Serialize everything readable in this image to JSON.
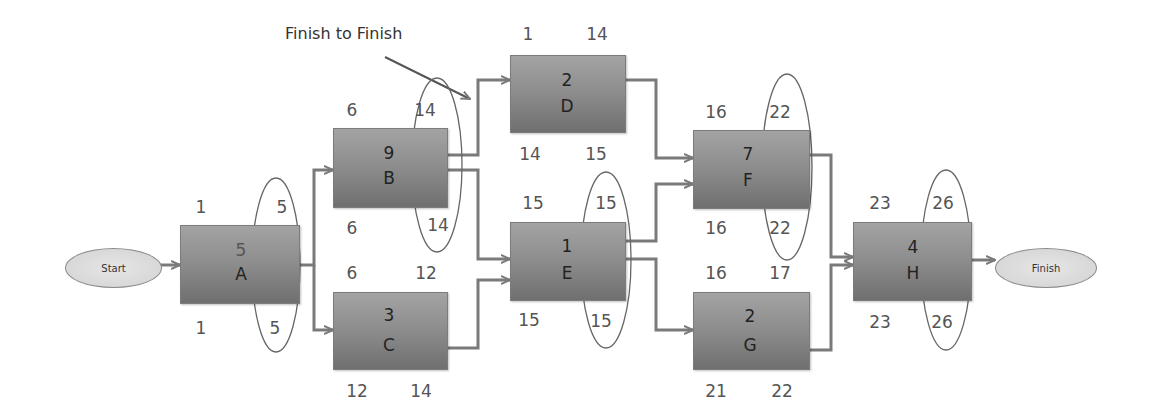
{
  "diagram": {
    "type": "network-diagram",
    "annotation": "Finish to Finish",
    "start_label": "Start",
    "finish_label": "Finish"
  },
  "activities": {
    "A": {
      "name": "A",
      "duration": "5",
      "es": "1",
      "ef": "5",
      "ls": "1",
      "lf": "5",
      "critical_circle": true
    },
    "B": {
      "name": "B",
      "duration": "9",
      "es": "6",
      "ef": "14",
      "ls": "6",
      "lf": "14",
      "critical_circle": true
    },
    "C": {
      "name": "C",
      "duration": "3",
      "es": "6",
      "ef": "12",
      "ls": "12",
      "lf": "14",
      "critical_circle": false
    },
    "D": {
      "name": "D",
      "duration": "2",
      "es": "1",
      "ef": "14",
      "ls": "14",
      "lf": "15",
      "critical_circle": false
    },
    "E": {
      "name": "E",
      "duration": "1",
      "es": "15",
      "ef": "15",
      "ls": "15",
      "lf": "15",
      "critical_circle": true
    },
    "F": {
      "name": "F",
      "duration": "7",
      "es": "16",
      "ef": "22",
      "ls": "16",
      "lf": "22",
      "critical_circle": true
    },
    "G": {
      "name": "G",
      "duration": "2",
      "es": "16",
      "ef": "17",
      "ls": "21",
      "lf": "22",
      "critical_circle": false
    },
    "H": {
      "name": "H",
      "duration": "4",
      "es": "23",
      "ef": "26",
      "ls": "23",
      "lf": "26",
      "critical_circle": true
    }
  },
  "edges": [
    {
      "from": "Start",
      "to": "A"
    },
    {
      "from": "A",
      "to": "B"
    },
    {
      "from": "A",
      "to": "C"
    },
    {
      "from": "B",
      "to": "D"
    },
    {
      "from": "B",
      "to": "E"
    },
    {
      "from": "C",
      "to": "E"
    },
    {
      "from": "D",
      "to": "F"
    },
    {
      "from": "E",
      "to": "F"
    },
    {
      "from": "E",
      "to": "G"
    },
    {
      "from": "F",
      "to": "H"
    },
    {
      "from": "G",
      "to": "H"
    },
    {
      "from": "H",
      "to": "Finish"
    }
  ],
  "colors": {
    "box_top": "#a3a3a3",
    "box_bottom": "#6f6f6f",
    "line": "#7a7a7a",
    "text": "#555555"
  }
}
